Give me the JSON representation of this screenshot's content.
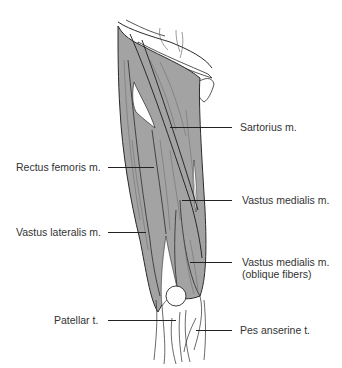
{
  "figure": {
    "colors": {
      "muscle": "#a3a3a3",
      "outline": "#2a2a2a",
      "tendon": "#ffffff",
      "leader": "#222222"
    },
    "labels": [
      {
        "id": "sartorius",
        "text": "Sartorius m."
      },
      {
        "id": "rectus-femoris",
        "text": "Rectus femoris m."
      },
      {
        "id": "vastus-medialis",
        "text": "Vastus medialis m."
      },
      {
        "id": "vastus-lateralis",
        "text": "Vastus lateralis m."
      },
      {
        "id": "vastus-medialis-oblique",
        "line1": "Vastus medialis m.",
        "line2": "(oblique fibers)"
      },
      {
        "id": "patellar-tendon",
        "text": "Patellar t."
      },
      {
        "id": "pes-anserine",
        "text": "Pes anserine t."
      }
    ]
  }
}
